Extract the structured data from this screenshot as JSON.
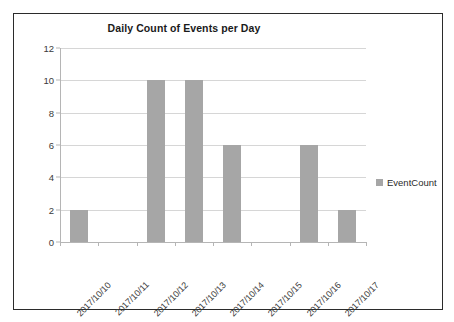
{
  "chart_data": {
    "type": "bar",
    "title": "Daily Count of Events per Day",
    "xlabel": "",
    "ylabel": "",
    "categories": [
      "2017/10/10",
      "2017/10/11",
      "2017/10/12",
      "2017/10/13",
      "2017/10/14",
      "2017/10/15",
      "2017/10/16",
      "2017/10/17"
    ],
    "series": [
      {
        "name": "EventCount",
        "values": [
          2,
          0,
          10,
          10,
          6,
          0,
          6,
          2
        ],
        "color": "#a6a6a6"
      }
    ],
    "ylim": [
      0,
      12
    ],
    "y_ticks": [
      0,
      2,
      4,
      6,
      8,
      10,
      12
    ],
    "y_tick_labels": [
      "0",
      "2",
      "4",
      "6",
      "8",
      "10",
      "12"
    ],
    "grid": true,
    "grid_axis": "y",
    "legend": {
      "position": "right",
      "entries": [
        "EventCount"
      ]
    },
    "colors": {
      "bar": "#a6a6a6",
      "gridline": "#d6d6d6",
      "axis": "#b5b5b5",
      "border": "#2b2b2b",
      "text": "#3a3a3a",
      "title_text": "#1a1a1a",
      "plot_background": "#ffffff"
    }
  }
}
